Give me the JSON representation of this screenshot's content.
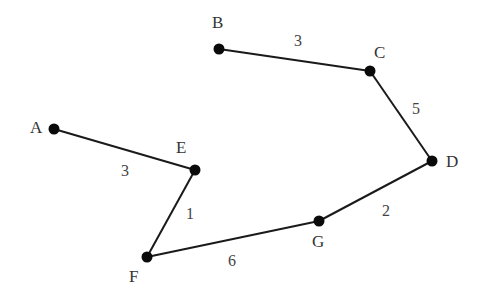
{
  "diagram": {
    "type": "weighted-graph",
    "nodes": [
      {
        "id": "A",
        "label": "A",
        "x": 54,
        "y": 129,
        "lx": 30,
        "ly": 133
      },
      {
        "id": "B",
        "label": "B",
        "x": 219,
        "y": 49,
        "lx": 212,
        "ly": 28
      },
      {
        "id": "C",
        "label": "C",
        "x": 370,
        "y": 71,
        "lx": 374,
        "ly": 58
      },
      {
        "id": "D",
        "label": "D",
        "x": 432,
        "y": 161,
        "lx": 446,
        "ly": 167
      },
      {
        "id": "E",
        "label": "E",
        "x": 195,
        "y": 170,
        "lx": 176,
        "ly": 153
      },
      {
        "id": "F",
        "label": "F",
        "x": 147,
        "y": 257,
        "lx": 129,
        "ly": 282
      },
      {
        "id": "G",
        "label": "G",
        "x": 319,
        "y": 221,
        "lx": 312,
        "ly": 247
      }
    ],
    "edges": [
      {
        "from": "A",
        "to": "E",
        "weight": "3",
        "wx": 121,
        "wy": 176
      },
      {
        "from": "E",
        "to": "F",
        "weight": "1",
        "wx": 186,
        "wy": 219
      },
      {
        "from": "F",
        "to": "G",
        "weight": "6",
        "wx": 228,
        "wy": 266
      },
      {
        "from": "G",
        "to": "D",
        "weight": "2",
        "wx": 382,
        "wy": 216
      },
      {
        "from": "D",
        "to": "C",
        "weight": "5",
        "wx": 412,
        "wy": 114
      },
      {
        "from": "C",
        "to": "B",
        "weight": "3",
        "wx": 294,
        "wy": 46
      }
    ]
  }
}
